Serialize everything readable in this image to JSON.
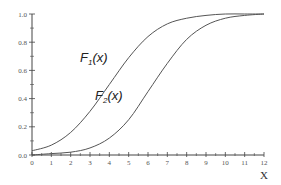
{
  "chart_data": {
    "type": "line",
    "title": "",
    "xlabel": "X",
    "ylabel": "",
    "xlim": [
      0,
      12
    ],
    "ylim": [
      0,
      1
    ],
    "grid": false,
    "x_ticks": [
      "0",
      "1",
      "2",
      "3",
      "4",
      "5",
      "6",
      "7",
      "8",
      "9",
      "10",
      "11",
      "12"
    ],
    "y_ticks": [
      "0.0",
      "0.2",
      "0.4",
      "0.6",
      "0.8",
      "1.0"
    ],
    "series": [
      {
        "name": "F1(x)",
        "label_main": "F",
        "label_sub": "1",
        "label_tail": "(x)",
        "x": [
          0,
          1,
          2,
          3,
          4,
          5,
          6,
          7,
          8,
          9,
          10,
          11,
          12
        ],
        "values": [
          0.03,
          0.07,
          0.16,
          0.31,
          0.5,
          0.69,
          0.84,
          0.93,
          0.97,
          0.99,
          1.0,
          1.0,
          1.0
        ]
      },
      {
        "name": "F2(x)",
        "label_main": "F",
        "label_sub": "2",
        "label_tail": "(x)",
        "x": [
          0,
          1,
          2,
          3,
          4,
          5,
          6,
          7,
          8,
          9,
          10,
          11,
          12
        ],
        "values": [
          0.0,
          0.01,
          0.02,
          0.05,
          0.12,
          0.25,
          0.45,
          0.65,
          0.82,
          0.92,
          0.97,
          0.99,
          1.0
        ]
      }
    ]
  }
}
